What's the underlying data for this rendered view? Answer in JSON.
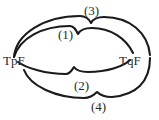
{
  "figure": {
    "background_color": "#ffffff",
    "stroke_color": "#1a1a1a",
    "text_color": "#2b2b2b",
    "width": 159,
    "height": 120,
    "endpoints": [
      {
        "id": "left",
        "label": "TpF",
        "x": 14,
        "y": 57
      },
      {
        "id": "right",
        "label": "TqF",
        "x": 131,
        "y": 57
      }
    ],
    "arcs": [
      {
        "id": "arc1",
        "label": "(1)",
        "name": "inner-upper-arc",
        "label_x": 58,
        "label_y": 28,
        "path": "M 14 57 C 20 38, 42 26, 70 26 C 74 26, 76 30, 78 34 C 80 30, 84 28, 92 28 C 110 28, 126 38, 133 53"
      },
      {
        "id": "arc2",
        "label": "(2)",
        "name": "inner-lower-arc",
        "label_x": 74,
        "label_y": 79,
        "path": "M 18 62 C 26 68, 46 74, 66 74 C 70 74, 72 70, 74 67 C 76 70, 80 72, 88 72 C 108 72, 124 66, 130 60"
      },
      {
        "id": "arc3",
        "label": "(3)",
        "name": "outer-upper-arc",
        "label_x": 84,
        "label_y": 4,
        "path": "M 14 57 C 16 34, 44 16, 80 16 C 86 16, 89 19, 91 23 C 93 19, 97 17, 104 17 C 130 17, 148 33, 150 55"
      },
      {
        "id": "arc4",
        "label": "(4)",
        "name": "outer-lower-arc",
        "label_x": 91,
        "label_y": 100,
        "path": "M 24 70 C 30 86, 56 98, 84 98 C 90 98, 94 95, 97 92 C 100 95, 104 97, 112 97 C 136 95, 150 82, 150 58"
      }
    ],
    "labels": {
      "left_endpoint": "TpF",
      "right_endpoint": "TqF",
      "arc_one": "(1)",
      "arc_two": "(2)",
      "arc_three": "(3)",
      "arc_four": "(4)"
    }
  }
}
